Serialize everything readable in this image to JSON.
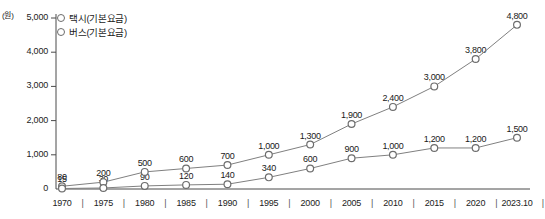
{
  "chart_data": {
    "type": "line",
    "title": "",
    "subtitle": "",
    "xlabel": "",
    "ylabel": "",
    "unit_label": "(원)",
    "grid": false,
    "legend_position": "top-left",
    "ylim": [
      0,
      5000
    ],
    "yticks": [
      "0",
      "1,000",
      "2,000",
      "3,000",
      "4,000",
      "5,000"
    ],
    "ytick_values": [
      0,
      1000,
      2000,
      3000,
      4000,
      5000
    ],
    "categories": [
      "1970",
      "1975",
      "1980",
      "1985",
      "1990",
      "1995",
      "2000",
      "2005",
      "2010",
      "2015",
      "2020",
      "2023.10"
    ],
    "series": [
      {
        "name": "택시(기본요금)",
        "values": [
          80,
          200,
          500,
          600,
          700,
          1000,
          1300,
          1900,
          2400,
          3000,
          3800,
          4800
        ],
        "labels": [
          "80",
          "200",
          "500",
          "600",
          "700",
          "1,000",
          "1,300",
          "1,900",
          "2,400",
          "3,000",
          "3,800",
          "4,800"
        ]
      },
      {
        "name": "버스(기본요금)",
        "values": [
          15,
          30,
          90,
          120,
          140,
          340,
          600,
          900,
          1000,
          1200,
          1200,
          1500
        ],
        "labels": [
          "15",
          "30",
          "90",
          "120",
          "140",
          "340",
          "600",
          "900",
          "1,000",
          "1,200",
          "1,200",
          "1,500"
        ]
      }
    ]
  },
  "colors": {
    "line": "#808080",
    "marker_stroke": "#6d6d6d",
    "marker_fill": "#ffffff",
    "axis": "#4a4a4a",
    "text": "#1a1a1a",
    "background": "#ffffff"
  },
  "legend": {
    "items": [
      {
        "label": "택시(기본요금)",
        "marker": "circle-outline-icon"
      },
      {
        "label": "버스(기본요금)",
        "marker": "circle-outline-icon"
      }
    ]
  }
}
